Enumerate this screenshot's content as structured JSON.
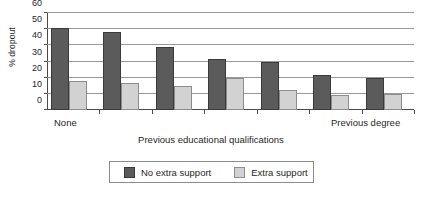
{
  "chart_data": {
    "type": "bar",
    "title": "",
    "xlabel": "Previous educational qualifications",
    "ylabel": "% dropout",
    "ylim": [
      0,
      60
    ],
    "yticks": [
      0,
      10,
      20,
      30,
      40,
      50,
      60
    ],
    "grid": true,
    "legend_position": "bottom",
    "categories": [
      "None",
      "",
      "",
      "",
      "",
      "",
      "Previous degree"
    ],
    "axis_end_labels": {
      "first": "None",
      "last": "Previous degree"
    },
    "series": [
      {
        "name": "No extra support",
        "color": "#5b5b5b",
        "values": [
          51,
          48,
          39,
          31.5,
          30,
          21.5,
          20
        ]
      },
      {
        "name": "Extra support",
        "color": "#d2d2d2",
        "values": [
          18,
          17,
          15,
          20,
          12.5,
          9,
          10
        ]
      }
    ]
  },
  "legend": {
    "items": [
      {
        "label": "No extra support"
      },
      {
        "label": "Extra support"
      }
    ]
  }
}
